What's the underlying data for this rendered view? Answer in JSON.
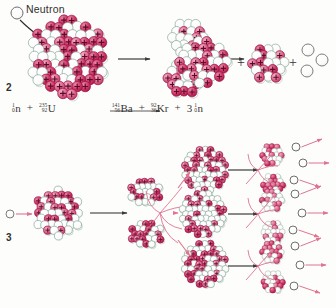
{
  "figure": {
    "type": "nuclear-fission-diagram",
    "background": "#fdfdfc",
    "panels": [
      {
        "id": "panel-2",
        "number": "2",
        "caption": "Induced fission of uranium-235 by a neutron"
      },
      {
        "id": "panel-3",
        "number": "3",
        "caption": "Chain reaction: each fission releases neutrons that trigger further fissions"
      }
    ]
  },
  "labels": {
    "neutron": "Neutron",
    "step2": "2",
    "step3": "3"
  },
  "colors": {
    "proton": "#c8245c",
    "proton_light": "#d9648c",
    "neutron_outline": "#7b9b8e",
    "arrow_black": "#2b2b2b",
    "arrow_pink": "#e0738f",
    "text": "#33302e"
  },
  "equation": {
    "reactants": [
      {
        "coefficient": "",
        "mass_number": "1",
        "atomic_number": "0",
        "symbol": "n"
      },
      {
        "coefficient": "",
        "mass_number": "235",
        "atomic_number": "92",
        "symbol": "U"
      }
    ],
    "products": [
      {
        "coefficient": "",
        "mass_number": "141",
        "atomic_number": "56",
        "symbol": "Ba"
      },
      {
        "coefficient": "",
        "mass_number": "92",
        "atomic_number": "36",
        "symbol": "Kr"
      },
      {
        "coefficient": "3",
        "mass_number": "1",
        "atomic_number": "0",
        "symbol": "n"
      }
    ],
    "plus": "+",
    "arrow": "⟶",
    "text_plain": "1/0 n + 235/92 U ⟶ 141/56 Ba + 92/36 Kr + 3 1/0 n"
  },
  "panel2": {
    "incoming_neutron": {
      "cx": 17,
      "cy": 13,
      "r": 6
    },
    "pointer_arrow": {
      "x1": 23,
      "y1": 20,
      "x2": 42,
      "y2": 38
    },
    "uranium_nucleus": {
      "cx": 68,
      "cy": 57,
      "r": 40,
      "protons": 38,
      "neutrons": 46
    },
    "arrow_1": {
      "x1": 117,
      "y1": 59,
      "x2": 148,
      "y2": 59
    },
    "deformed_nucleus": {
      "cx": 186,
      "cy": 58,
      "rx": 30,
      "ry": 40
    },
    "arrow_2": {
      "x1": 212,
      "y1": 59,
      "x2": 240,
      "y2": 59
    },
    "barium_fragment": {
      "cx": 203,
      "cy": 62,
      "r": 25
    },
    "krypton_fragment": {
      "cx": 268,
      "cy": 63,
      "r": 18
    },
    "free_neutrons": [
      {
        "cx": 308,
        "cy": 50,
        "r": 6
      },
      {
        "cx": 322,
        "cy": 60,
        "r": 6
      },
      {
        "cx": 307,
        "cy": 71,
        "r": 6
      }
    ],
    "plus_signs": [
      {
        "x": 240,
        "y": 62
      },
      {
        "x": 291,
        "y": 62
      }
    ]
  },
  "panel3": {
    "generations": 3,
    "neutrons_per_fission": 3,
    "gen1": {
      "incoming_neutron": {
        "cx": 10,
        "cy": 214,
        "r": 4
      },
      "nucleus": {
        "cx": 58,
        "cy": 213,
        "r": 25
      },
      "arrow": {
        "x1": 90,
        "y1": 213,
        "x2": 128,
        "y2": 213
      },
      "fragment_top": {
        "cx": 145,
        "cy": 192,
        "r": 16
      },
      "fragment_bottom": {
        "cx": 146,
        "cy": 234,
        "r": 16
      },
      "emitted_neutrons": 3
    },
    "gen2_nuclei": [
      {
        "cx": 205,
        "cy": 170,
        "r": 22
      },
      {
        "cx": 203,
        "cy": 214,
        "r": 23
      },
      {
        "cx": 205,
        "cy": 264,
        "r": 22
      }
    ],
    "gen2_arrows": [
      {
        "x1": 228,
        "y1": 170,
        "x2": 258,
        "y2": 170
      },
      {
        "x1": 228,
        "y1": 214,
        "x2": 258,
        "y2": 214
      },
      {
        "x1": 228,
        "y1": 266,
        "x2": 258,
        "y2": 266
      }
    ],
    "gen2_fragment_pairs": [
      {
        "top": {
          "cx": 272,
          "cy": 155,
          "r": 13
        },
        "bottom": {
          "cx": 273,
          "cy": 185,
          "r": 13
        }
      },
      {
        "top": {
          "cx": 272,
          "cy": 200,
          "r": 13
        },
        "bottom": {
          "cx": 273,
          "cy": 232,
          "r": 13
        }
      },
      {
        "top": {
          "cx": 272,
          "cy": 252,
          "r": 13
        },
        "bottom": {
          "cx": 273,
          "cy": 282,
          "r": 13
        }
      }
    ],
    "gen3_neutrons": [
      {
        "cx": 296,
        "cy": 147,
        "r": 4
      },
      {
        "cx": 303,
        "cy": 163,
        "r": 4
      },
      {
        "cx": 294,
        "cy": 180,
        "r": 4
      },
      {
        "cx": 295,
        "cy": 194,
        "r": 4
      },
      {
        "cx": 302,
        "cy": 213,
        "r": 4
      },
      {
        "cx": 293,
        "cy": 230,
        "r": 4
      },
      {
        "cx": 295,
        "cy": 246,
        "r": 4
      },
      {
        "cx": 300,
        "cy": 265,
        "r": 4
      },
      {
        "cx": 294,
        "cy": 286,
        "r": 4
      }
    ]
  }
}
